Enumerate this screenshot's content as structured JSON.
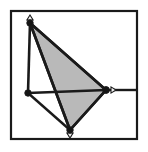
{
  "figure": {
    "title": "",
    "type": "truss-mechanism-diagram",
    "canvas": {
      "width": 148,
      "height": 152,
      "background": "#ffffff"
    },
    "frame": {
      "name": "outer-frame",
      "x": 11,
      "y": 11,
      "width": 126,
      "height": 128,
      "stroke": "#1a1a1a",
      "stroke_width": 2.2,
      "fill": "none"
    },
    "colors": {
      "line": "#1a1a1a",
      "fill_gray": "#b9b9b9",
      "node_fill": "#151515",
      "marker_fill": "#f2f2f2",
      "marker_stroke": "#1a1a1a",
      "background": "#ffffff"
    },
    "shaded_polygon": {
      "name": "shaded-triangle",
      "points": "30,23 106,90 70,130",
      "fill": "#b9b9b9",
      "stroke": "#1a1a1a",
      "stroke_width": 2.6
    },
    "nodes": [
      {
        "id": "A",
        "label": "",
        "x": 30,
        "y": 23,
        "r": 3.2
      },
      {
        "id": "B",
        "label": "",
        "x": 28,
        "y": 93,
        "r": 3.2
      },
      {
        "id": "C",
        "label": "",
        "x": 106,
        "y": 90,
        "r": 3.4
      },
      {
        "id": "D",
        "label": "",
        "x": 70,
        "y": 130,
        "r": 3.2
      }
    ],
    "members": [
      {
        "id": "AB",
        "name": "member-a-b",
        "x1": 30,
        "y1": 23,
        "x2": 28,
        "y2": 93,
        "stroke_width": 2.6
      },
      {
        "id": "AC",
        "name": "member-a-c",
        "x1": 30,
        "y1": 23,
        "x2": 106,
        "y2": 90,
        "stroke_width": 2.6
      },
      {
        "id": "AD",
        "name": "member-a-d",
        "x1": 30,
        "y1": 23,
        "x2": 70,
        "y2": 130,
        "stroke_width": 2.6
      },
      {
        "id": "BC",
        "name": "member-b-c",
        "x1": 28,
        "y1": 93,
        "x2": 106,
        "y2": 90,
        "stroke_width": 2.4
      },
      {
        "id": "BD",
        "name": "member-b-d",
        "x1": 28,
        "y1": 93,
        "x2": 70,
        "y2": 130,
        "stroke_width": 2.4
      },
      {
        "id": "CD",
        "name": "member-c-d",
        "x1": 106,
        "y1": 90,
        "x2": 70,
        "y2": 130,
        "stroke_width": 2.6
      },
      {
        "id": "CR",
        "name": "member-c-right-edge",
        "x1": 106,
        "y1": 90,
        "x2": 137,
        "y2": 90,
        "stroke_width": 2.4
      },
      {
        "id": "DB2",
        "name": "member-d-bottom-edge",
        "x1": 70,
        "y1": 130,
        "x2": 70,
        "y2": 137,
        "stroke_width": 2.4
      }
    ],
    "markers": [
      {
        "id": "M1",
        "name": "arrow-marker-top",
        "at_node": "A",
        "direction": "up",
        "x": 30,
        "y": 23,
        "size": 5
      },
      {
        "id": "M2",
        "name": "arrow-marker-right",
        "at_node": "C",
        "direction": "right",
        "x": 106,
        "y": 90,
        "size": 5
      },
      {
        "id": "M3",
        "name": "arrow-marker-bottom",
        "at_node": "D",
        "direction": "down",
        "x": 70,
        "y": 130,
        "size": 5
      }
    ]
  }
}
